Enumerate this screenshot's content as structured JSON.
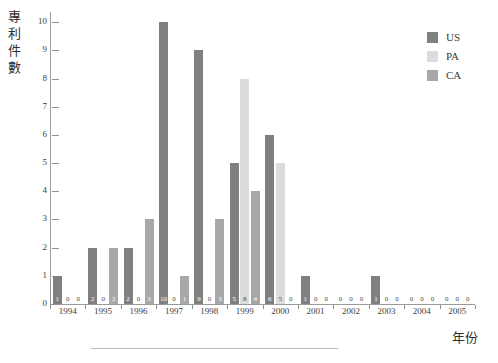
{
  "chart_data": {
    "type": "bar",
    "title": "",
    "subtitle": "",
    "xlabel": "年份",
    "ylabel": "專利件數",
    "categories": [
      "1994",
      "1995",
      "1996",
      "1997",
      "1998",
      "1999",
      "2000",
      "2001",
      "2002",
      "2003",
      "2004",
      "2005"
    ],
    "series": [
      {
        "name": "US",
        "color": "#808080",
        "values": [
          1,
          2,
          2,
          10,
          9,
          5,
          6,
          1,
          0,
          1,
          0,
          0
        ]
      },
      {
        "name": "PA",
        "color": "#dcdcdc",
        "values": [
          0,
          0,
          0,
          0,
          0,
          8,
          5,
          0,
          0,
          0,
          0,
          0
        ]
      },
      {
        "name": "CA",
        "color": "#a8a8a8",
        "values": [
          0,
          2,
          3,
          1,
          3,
          4,
          0,
          0,
          0,
          0,
          0,
          0
        ]
      }
    ],
    "ylim": [
      0,
      10
    ],
    "ytick_labels": [
      "0",
      "1",
      "2",
      "3",
      "4",
      "5",
      "6",
      "7",
      "8",
      "9",
      "10"
    ],
    "grid": false,
    "legend_position": "right-top",
    "data_labels": true
  },
  "legend": {
    "items": [
      {
        "label": "US",
        "color": "#808080"
      },
      {
        "label": "PA",
        "color": "#dcdcdc"
      },
      {
        "label": "CA",
        "color": "#a8a8a8"
      }
    ]
  },
  "axes": {
    "y_title": "專利件數",
    "x_title": "年份"
  }
}
